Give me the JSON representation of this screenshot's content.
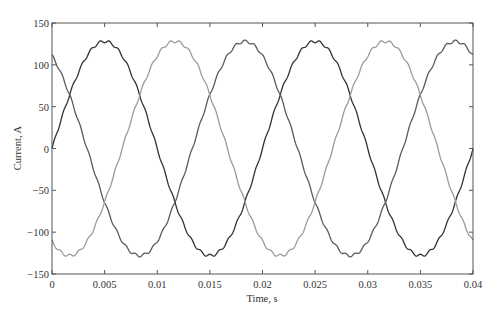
{
  "chart_data": {
    "type": "line",
    "title": "",
    "xlabel": "Time, s",
    "ylabel": "Current, A",
    "xlim": [
      0,
      0.04
    ],
    "ylim": [
      -150,
      150
    ],
    "xticks": [
      0,
      0.005,
      0.01,
      0.015,
      0.02,
      0.025,
      0.03,
      0.035,
      0.04
    ],
    "xtick_labels": [
      "0",
      "0.005",
      "0.01",
      "0.015",
      "0.02",
      "0.025",
      "0.03",
      "0.035",
      "0.04"
    ],
    "yticks": [
      150,
      100,
      50,
      0,
      -50,
      -100,
      -150
    ],
    "ytick_labels": [
      "150",
      "100",
      "50",
      "0",
      "−50",
      "−100",
      "−150"
    ],
    "grid": false,
    "legend": null,
    "x": [
      0,
      0.0005,
      0.001,
      0.0015,
      0.002,
      0.0025,
      0.003,
      0.0035,
      0.004,
      0.0045,
      0.005,
      0.0055,
      0.006,
      0.0065,
      0.007,
      0.0075,
      0.008,
      0.0085,
      0.009,
      0.0095,
      0.01,
      0.0105,
      0.011,
      0.0115,
      0.012,
      0.0125,
      0.013,
      0.0135,
      0.014,
      0.0145,
      0.015,
      0.0155,
      0.016,
      0.0165,
      0.017,
      0.0175,
      0.018,
      0.0185,
      0.019,
      0.0195,
      0.02,
      0.0205,
      0.021,
      0.0215,
      0.022,
      0.0225,
      0.023,
      0.0235,
      0.024,
      0.0245,
      0.025,
      0.0255,
      0.026,
      0.0265,
      0.027,
      0.0275,
      0.028,
      0.0285,
      0.029,
      0.0295,
      0.03,
      0.0305,
      0.031,
      0.0315,
      0.032,
      0.0325,
      0.033,
      0.0335,
      0.034,
      0.0345,
      0.035,
      0.0355,
      0.036,
      0.0365,
      0.037,
      0.0375,
      0.038,
      0.0385,
      0.039,
      0.0395,
      0.04
    ],
    "series": [
      {
        "name": "Phase A",
        "color": "#333333",
        "values": [
          0,
          20,
          40,
          58,
          75,
          91,
          104,
          114,
          122,
          126,
          128,
          126,
          122,
          114,
          104,
          91,
          75,
          58,
          40,
          20,
          0,
          -20,
          -40,
          -58,
          -75,
          -91,
          -104,
          -114,
          -122,
          -126,
          -128,
          -126,
          -122,
          -114,
          -104,
          -91,
          -75,
          -58,
          -40,
          -20,
          0,
          20,
          40,
          58,
          75,
          91,
          104,
          114,
          122,
          126,
          128,
          126,
          122,
          114,
          104,
          91,
          75,
          58,
          40,
          20,
          0,
          -20,
          -40,
          -58,
          -75,
          -91,
          -104,
          -114,
          -122,
          -126,
          -128,
          -126,
          -122,
          -114,
          -104,
          -91,
          -75,
          -58,
          -40,
          -20,
          0
        ]
      },
      {
        "name": "Phase B",
        "color": "#5a5a5a",
        "values": [
          111,
          101,
          90,
          76,
          61,
          44,
          27,
          9,
          -9,
          -27,
          -44,
          -61,
          -76,
          -90,
          -101,
          -111,
          -119,
          -124,
          -127,
          -128,
          -126,
          -122,
          -116,
          -107,
          -96,
          -83,
          -68,
          -51,
          -33,
          -15,
          3,
          22,
          40,
          57,
          73,
          87,
          100,
          111,
          119,
          124,
          111,
          101,
          90,
          76,
          61,
          44,
          27,
          9,
          -9,
          -27,
          -44,
          -61,
          -76,
          -90,
          -101,
          -111,
          -119,
          -124,
          -127,
          -128,
          -126,
          -122,
          -116,
          -107,
          -96,
          -83,
          -68,
          -51,
          -33,
          -15,
          3,
          22,
          40,
          57,
          73,
          87,
          100,
          111,
          119,
          124,
          111
        ]
      },
      {
        "name": "Phase C",
        "color": "#9a9a9a",
        "values": [
          -111,
          -121,
          -126,
          -128,
          -127,
          -122,
          -115,
          -105,
          -93,
          -79,
          -64,
          -47,
          -29,
          -11,
          7,
          25,
          43,
          60,
          75,
          89,
          101,
          111,
          119,
          124,
          128,
          127,
          124,
          118,
          109,
          98,
          84,
          68,
          51,
          33,
          15,
          -4,
          -22,
          -40,
          -57,
          -73,
          -111,
          -121,
          -126,
          -128,
          -127,
          -122,
          -115,
          -105,
          -93,
          -79,
          -64,
          -47,
          -29,
          -11,
          7,
          25,
          43,
          60,
          75,
          89,
          101,
          111,
          119,
          124,
          128,
          127,
          124,
          118,
          109,
          98,
          84,
          68,
          51,
          33,
          15,
          -4,
          -22,
          -40,
          -57,
          -73,
          -111
        ]
      }
    ],
    "series_model": {
      "amplitude": 128,
      "frequency_hz": 50,
      "phase_A_deg": 0,
      "phase_B_deg": 120,
      "phase_C_deg": -120
    }
  }
}
